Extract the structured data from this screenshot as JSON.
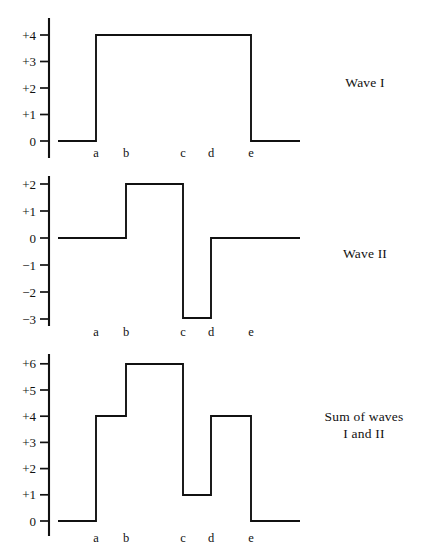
{
  "figure": {
    "background_color": "#ffffff",
    "line_color": "#111111"
  },
  "panels": [
    {
      "id": "wave-1",
      "side_label": "Wave I",
      "chart_data": {
        "type": "line",
        "title": "Wave I",
        "xlabel": "",
        "ylabel": "",
        "grid": false,
        "legend": "none",
        "style": "step",
        "xlim": [
          0,
          1
        ],
        "ylim": [
          0,
          4
        ],
        "x_tick_labels": [
          "a",
          "b",
          "c",
          "d",
          "e"
        ],
        "y_tick_labels": [
          "0",
          "+1",
          "+2",
          "+3",
          "+4"
        ],
        "y_tick_values": [
          0,
          1,
          2,
          3,
          4
        ],
        "segments": [
          {
            "from": "start",
            "to": "a",
            "value": 0
          },
          {
            "from": "a",
            "to": "e",
            "value": 4
          },
          {
            "from": "e",
            "to": "end",
            "value": 0
          }
        ],
        "values_at_intervals": [
          0,
          4,
          4,
          4,
          4,
          0
        ]
      }
    },
    {
      "id": "wave-2",
      "side_label": "Wave II",
      "chart_data": {
        "type": "line",
        "title": "Wave II",
        "xlabel": "",
        "ylabel": "",
        "grid": false,
        "legend": "none",
        "style": "step",
        "xlim": [
          0,
          1
        ],
        "ylim": [
          -3,
          2
        ],
        "x_tick_labels": [
          "a",
          "b",
          "c",
          "d",
          "e"
        ],
        "y_tick_labels": [
          "+2",
          "+1",
          "0",
          "−1",
          "−2",
          "−3"
        ],
        "y_tick_values": [
          2,
          1,
          0,
          -1,
          -2,
          -3
        ],
        "segments": [
          {
            "from": "start",
            "to": "b",
            "value": 0
          },
          {
            "from": "b",
            "to": "c",
            "value": 2
          },
          {
            "from": "c",
            "to": "d",
            "value": -3
          },
          {
            "from": "d",
            "to": "end",
            "value": 0
          }
        ],
        "values_at_intervals": [
          0,
          0,
          2,
          -3,
          0,
          0
        ]
      }
    },
    {
      "id": "wave-sum",
      "side_label": "Sum of waves\nI and II",
      "chart_data": {
        "type": "line",
        "title": "Sum of waves I and II",
        "xlabel": "",
        "ylabel": "",
        "grid": false,
        "legend": "none",
        "style": "step",
        "xlim": [
          0,
          1
        ],
        "ylim": [
          0,
          6
        ],
        "x_tick_labels": [
          "a",
          "b",
          "c",
          "d",
          "e"
        ],
        "y_tick_labels": [
          "0",
          "+1",
          "+2",
          "+3",
          "+4",
          "+5",
          "+6"
        ],
        "y_tick_values": [
          0,
          1,
          2,
          3,
          4,
          5,
          6
        ],
        "segments": [
          {
            "from": "start",
            "to": "a",
            "value": 0
          },
          {
            "from": "a",
            "to": "b",
            "value": 4
          },
          {
            "from": "b",
            "to": "c",
            "value": 6
          },
          {
            "from": "c",
            "to": "d",
            "value": 1
          },
          {
            "from": "d",
            "to": "e",
            "value": 4
          },
          {
            "from": "e",
            "to": "end",
            "value": 0
          }
        ],
        "values_at_intervals": [
          0,
          4,
          6,
          1,
          4,
          0
        ]
      }
    }
  ],
  "x_marker_positions": {
    "a": 96,
    "b": 126,
    "c": 183,
    "d": 211,
    "e": 251
  }
}
